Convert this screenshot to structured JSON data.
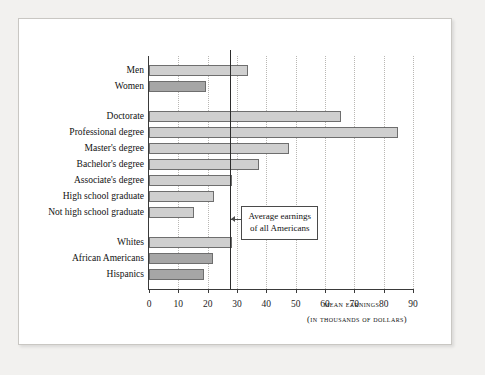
{
  "chart_data": {
    "type": "bar",
    "orientation": "horizontal",
    "title": "",
    "xlabel": "Mean earnings",
    "xlabel_sub": "(in thousands of dollars)",
    "ylabel": "",
    "xlim": [
      0,
      90
    ],
    "xticks": [
      0,
      10,
      20,
      30,
      40,
      50,
      60,
      70,
      80,
      90
    ],
    "xtick_labels": [
      "0",
      "10",
      "20",
      "30",
      "40",
      "50",
      "60",
      "70",
      "80",
      "90"
    ],
    "grid": true,
    "grid_axis": "x",
    "legend": "none",
    "bar_fill_light": "#cfcfcf",
    "bar_fill_dark": "#a6a6a6",
    "bar_edge": "#6e6e6e",
    "axis_color": "#3a3a3a",
    "reference_line": {
      "value": 27.7,
      "label_line1": "Average earnings",
      "label_line2": "of all Americans",
      "color": "#2c2c2c"
    },
    "groups": [
      {
        "name": "gender",
        "bars": [
          {
            "category": "Men",
            "value": 33.7,
            "shade": "light"
          },
          {
            "category": "Women",
            "value": 19.4,
            "shade": "dark"
          }
        ]
      },
      {
        "name": "education",
        "bars": [
          {
            "category": "Doctorate",
            "value": 65.5,
            "shade": "light"
          },
          {
            "category": "Professional degree",
            "value": 85.0,
            "shade": "light"
          },
          {
            "category": "Master's degree",
            "value": 47.6,
            "shade": "light"
          },
          {
            "category": "Bachelor's degree",
            "value": 37.5,
            "shade": "light"
          },
          {
            "category": "Associate's degree",
            "value": 28.4,
            "shade": "light"
          },
          {
            "category": "High school graduate",
            "value": 22.3,
            "shade": "light"
          },
          {
            "category": "Not high school graduate",
            "value": 15.2,
            "shade": "light"
          }
        ]
      },
      {
        "name": "race",
        "bars": [
          {
            "category": "Whites",
            "value": 28.2,
            "shade": "light"
          },
          {
            "category": "African Americans",
            "value": 21.8,
            "shade": "dark"
          },
          {
            "category": "Hispanics",
            "value": 18.8,
            "shade": "dark"
          }
        ]
      }
    ]
  }
}
